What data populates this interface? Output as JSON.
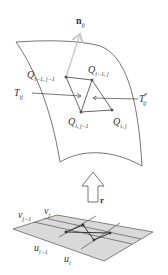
{
  "diagram": {
    "type": "parametric surface mapping",
    "colors": {
      "line": "#555555",
      "light_arrow": "#c8c8c8",
      "plane_fill": "#d9d9d9",
      "point": "#444444"
    },
    "normal": {
      "base": "n",
      "sub": "ij"
    },
    "surface_points": [
      {
        "id": "q_im1_jm1",
        "base": "Q",
        "sub": "i−1, j−1"
      },
      {
        "id": "q_im1_j",
        "base": "Q",
        "sub": "i−1, j"
      },
      {
        "id": "q_i_jm1",
        "base": "Q",
        "sub": "i, j−1"
      },
      {
        "id": "q_i_j",
        "base": "Q",
        "sub": "i, j"
      }
    ],
    "triangles": {
      "left": {
        "base": "T",
        "sub": "ij"
      },
      "right": {
        "base": "T",
        "sub": "ij",
        "sup": "*"
      }
    },
    "mapping": {
      "label": "r"
    },
    "parameter_grid": {
      "v_labels": [
        {
          "base": "v",
          "sub": "j−1"
        },
        {
          "base": "v",
          "sub": "j"
        }
      ],
      "u_labels": [
        {
          "base": "u",
          "sub": "i−1"
        },
        {
          "base": "u",
          "sub": "i"
        }
      ]
    }
  }
}
